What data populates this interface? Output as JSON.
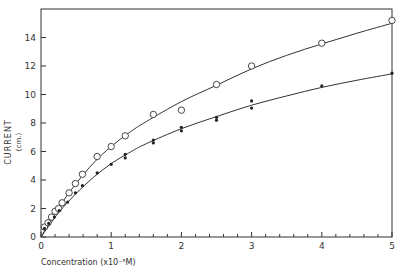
{
  "chart_data": {
    "type": "scatter",
    "title": "",
    "xlabel": "Concentration (x10⁻⁵M)",
    "ylabel": "CURRENT",
    "ylabel_unit": "(cm.)",
    "xlim": [
      0,
      5
    ],
    "ylim": [
      0,
      16
    ],
    "x_ticks": [
      0,
      1,
      2,
      3,
      4,
      5
    ],
    "x_minor_step": 0.2,
    "y_ticks": [
      0,
      2,
      4,
      6,
      8,
      10,
      12,
      14
    ],
    "grid": false,
    "legend": null,
    "series": [
      {
        "name": "open circles",
        "marker": "open-circle",
        "points": [
          [
            0.05,
            0.7
          ],
          [
            0.1,
            1.0
          ],
          [
            0.15,
            1.4
          ],
          [
            0.2,
            1.8
          ],
          [
            0.25,
            2.0
          ],
          [
            0.3,
            2.4
          ],
          [
            0.4,
            3.1
          ],
          [
            0.49,
            3.75
          ],
          [
            0.59,
            4.4
          ],
          [
            0.8,
            5.65
          ],
          [
            1.0,
            6.35
          ],
          [
            1.2,
            7.1
          ],
          [
            1.6,
            8.6
          ],
          [
            2.0,
            8.9
          ],
          [
            2.5,
            10.7
          ],
          [
            3.0,
            12.0
          ],
          [
            4.0,
            13.6
          ],
          [
            5.0,
            15.2
          ]
        ],
        "fit_curve": [
          [
            0,
            0
          ],
          [
            0.25,
            2.05
          ],
          [
            0.5,
            3.75
          ],
          [
            0.75,
            5.2
          ],
          [
            1.0,
            6.35
          ],
          [
            1.25,
            7.3
          ],
          [
            1.5,
            8.1
          ],
          [
            2.0,
            9.5
          ],
          [
            2.5,
            10.65
          ],
          [
            3.0,
            11.8
          ],
          [
            3.5,
            12.75
          ],
          [
            4.0,
            13.55
          ],
          [
            4.5,
            14.3
          ],
          [
            5.0,
            15.0
          ]
        ]
      },
      {
        "name": "filled points",
        "marker": "filled-dot",
        "points": [
          [
            0.05,
            0.6
          ],
          [
            0.11,
            0.95
          ],
          [
            0.19,
            1.4
          ],
          [
            0.26,
            1.85
          ],
          [
            0.38,
            2.45
          ],
          [
            0.49,
            3.1
          ],
          [
            0.59,
            3.6
          ],
          [
            0.8,
            4.5
          ],
          [
            1.0,
            5.1
          ],
          [
            1.2,
            5.8
          ],
          [
            1.2,
            5.55
          ],
          [
            1.6,
            6.8
          ],
          [
            1.6,
            6.6
          ],
          [
            2.0,
            7.7
          ],
          [
            2.0,
            7.45
          ],
          [
            2.5,
            8.4
          ],
          [
            2.5,
            8.2
          ],
          [
            3.0,
            9.55
          ],
          [
            3.0,
            9.05
          ],
          [
            4.0,
            10.6
          ],
          [
            5.0,
            11.5
          ]
        ],
        "fit_curve": [
          [
            0,
            0
          ],
          [
            0.25,
            1.7
          ],
          [
            0.5,
            3.05
          ],
          [
            0.75,
            4.2
          ],
          [
            1.0,
            5.15
          ],
          [
            1.25,
            5.9
          ],
          [
            1.5,
            6.55
          ],
          [
            2.0,
            7.6
          ],
          [
            2.5,
            8.45
          ],
          [
            3.0,
            9.25
          ],
          [
            3.5,
            9.9
          ],
          [
            4.0,
            10.5
          ],
          [
            4.5,
            11.0
          ],
          [
            5.0,
            11.45
          ]
        ]
      }
    ]
  }
}
